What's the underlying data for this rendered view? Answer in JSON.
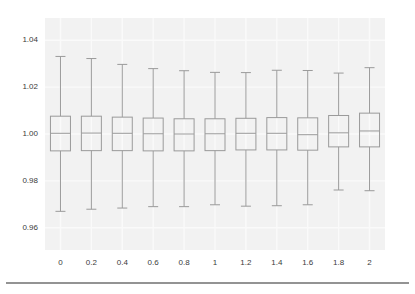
{
  "figure": {
    "background_color": "#ffffff",
    "plot_background_color": "#f2f2f2",
    "grid_color": "#fafafa",
    "box_line_color": "#9a9a9a",
    "whisker_color": "#9a9a9a",
    "median_color": "#9a9a9a",
    "axis_rule_color": "#6f6f6f",
    "tick_text_color": "#3b3b3b"
  },
  "chart_data": {
    "type": "box",
    "title": "",
    "subtitle": "",
    "xlabel": "",
    "ylabel": "",
    "grid": true,
    "legend": false,
    "legend_position": "none",
    "xlim": [
      -0.5,
      10.5
    ],
    "ylim": [
      0.9505,
      1.0495
    ],
    "y_ticks": [
      0.96,
      0.98,
      1.0,
      1.02,
      1.04
    ],
    "y_tick_labels": [
      "0.96",
      "0.98",
      "1.00",
      "1.02",
      "1.04"
    ],
    "categories": [
      "0",
      "0.2",
      "0.4",
      "0.6",
      "0.8",
      "1",
      "1.2",
      "1.4",
      "1.6",
      "1.8",
      "2"
    ],
    "x_tick_labels": [
      "0",
      "0.2",
      "0.4",
      "0.6",
      "0.8",
      "1",
      "1.2",
      "1.4",
      "1.6",
      "1.8",
      "2"
    ],
    "boxes": [
      {
        "category": "0",
        "whisker_low": 0.967,
        "q1": 0.9928,
        "median": 1.0003,
        "q3": 1.0076,
        "whisker_high": 1.0331
      },
      {
        "category": "0.2",
        "whisker_low": 0.9679,
        "q1": 0.9929,
        "median": 1.0004,
        "q3": 1.0076,
        "whisker_high": 1.0322
      },
      {
        "category": "0.4",
        "whisker_low": 0.9684,
        "q1": 0.9929,
        "median": 1.0003,
        "q3": 1.0072,
        "whisker_high": 1.0297
      },
      {
        "category": "0.6",
        "whisker_low": 0.969,
        "q1": 0.9928,
        "median": 1.0001,
        "q3": 1.0068,
        "whisker_high": 1.0279
      },
      {
        "category": "0.8",
        "whisker_low": 0.969,
        "q1": 0.9928,
        "median": 1.0,
        "q3": 1.0065,
        "whisker_high": 1.027
      },
      {
        "category": "1",
        "whisker_low": 0.9698,
        "q1": 0.9929,
        "median": 1.0001,
        "q3": 1.0065,
        "whisker_high": 1.0263
      },
      {
        "category": "1.2",
        "whisker_low": 0.9692,
        "q1": 0.9932,
        "median": 1.0003,
        "q3": 1.0067,
        "whisker_high": 1.0262
      },
      {
        "category": "1.4",
        "whisker_low": 0.9694,
        "q1": 0.9932,
        "median": 1.0003,
        "q3": 1.007,
        "whisker_high": 1.0272
      },
      {
        "category": "1.6",
        "whisker_low": 0.9698,
        "q1": 0.9931,
        "median": 0.9997,
        "q3": 1.0069,
        "whisker_high": 1.0271
      },
      {
        "category": "1.8",
        "whisker_low": 0.9761,
        "q1": 0.9945,
        "median": 1.0005,
        "q3": 1.0079,
        "whisker_high": 1.026
      },
      {
        "category": "2",
        "whisker_low": 0.9758,
        "q1": 0.9945,
        "median": 1.0013,
        "q3": 1.0089,
        "whisker_high": 1.0283
      }
    ]
  }
}
